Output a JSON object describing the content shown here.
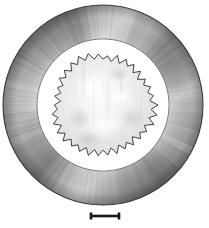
{
  "figure": {
    "kind": "electron-micrograph",
    "background_color": "#ffffff",
    "width_px": 209,
    "height_px": 228,
    "caption_text": ""
  },
  "specimen": {
    "name": "annular-specimen",
    "center_x": 103,
    "center_y": 105,
    "outer_ring": {
      "name": "outer-annulus",
      "outer_radius": 100,
      "inner_radius": 66,
      "base_color": "#9a9a9a",
      "highlight_color": "#e8e8e8",
      "shadow_color": "#5f5f5f",
      "edge_color": "#3a3a3a",
      "radial_band_count": 72,
      "striation_count": 180
    },
    "inner_gap": {
      "name": "inner-white-gap",
      "outer_radius": 66,
      "inner_radius": 50,
      "color": "#ffffff"
    },
    "inner_disc": {
      "name": "serrated-inner-disc",
      "mean_radius": 49,
      "spike_count": 68,
      "spike_amplitude": 3.2,
      "outline_color": "#2f2f2f",
      "fill_color": "#e4e4e4",
      "highlight_color": "#fbfbfb",
      "shadow_color": "#c9c9c9"
    }
  },
  "scale_bar": {
    "name": "scale-bar",
    "label": "",
    "x_start": 91,
    "x_end": 119,
    "y": 216,
    "line_thickness": 2.6,
    "cap_height": 7,
    "cap_thickness": 2.6,
    "color": "#171717"
  }
}
